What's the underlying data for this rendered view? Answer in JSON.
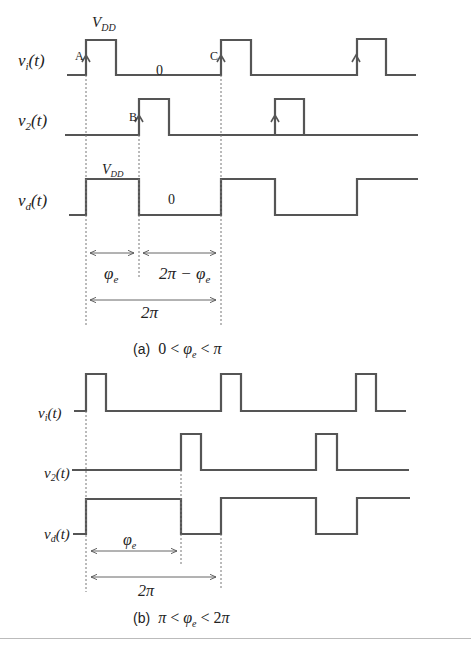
{
  "part_a": {
    "caption_prefix": "(a)",
    "caption_math": "0 < φe < π",
    "signals": {
      "v1": {
        "label": "v",
        "sub": "i",
        "arg": "(t)"
      },
      "v2": {
        "label": "v",
        "sub": "2",
        "arg": "(t)"
      },
      "vd": {
        "label": "v",
        "sub": "d",
        "arg": "(t)"
      }
    },
    "annotations": {
      "vdd_top": "V",
      "vdd_top_sub": "DD",
      "zero_top": "0",
      "vdd_mid": "V",
      "vdd_mid_sub": "DD",
      "zero_mid": "0",
      "point_a": "A",
      "point_b": "B",
      "point_c": "C",
      "phi_e": "φ",
      "phi_e_sub": "e",
      "two_pi_minus_phi": "2π − φ",
      "two_pi_minus_phi_sub": "e",
      "two_pi": "2π"
    }
  },
  "part_b": {
    "caption_prefix": "(b)",
    "caption_math": "π < φe < 2π",
    "signals": {
      "v1": {
        "label": "v",
        "sub": "i",
        "arg": "(t)"
      },
      "v2": {
        "label": "v",
        "sub": "2",
        "arg": "(t)"
      },
      "vd": {
        "label": "v",
        "sub": "d",
        "arg": "(t)"
      }
    },
    "annotations": {
      "phi_e": "φ",
      "phi_e_sub": "e",
      "two_pi": "2π"
    }
  }
}
